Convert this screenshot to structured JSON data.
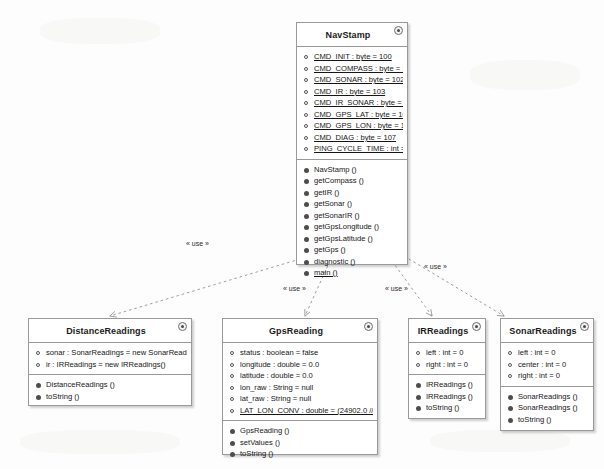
{
  "diagram": {
    "relationship_label": "« use »",
    "classes": [
      {
        "id": "navstamp",
        "name": "NavStamp",
        "icon": "class-badge-icon",
        "attributes": [
          {
            "text": "CMD_INIT : byte = 100",
            "static": true
          },
          {
            "text": "CMD_COMPASS : byte = 101",
            "static": true
          },
          {
            "text": "CMD_SONAR : byte = 102",
            "static": true
          },
          {
            "text": "CMD_IR : byte = 103",
            "static": true
          },
          {
            "text": "CMD_IR_SONAR : byte = 104",
            "static": true
          },
          {
            "text": "CMD_GPS_LAT : byte = 105",
            "static": true
          },
          {
            "text": "CMD_GPS_LON : byte = 106",
            "static": true
          },
          {
            "text": "CMD_DIAG : byte = 107",
            "static": true
          },
          {
            "text": "PING_CYCLE_TIME : int = 200",
            "static": true
          }
        ],
        "operations": [
          {
            "text": "NavStamp ()",
            "static": false
          },
          {
            "text": "getCompass ()",
            "static": false
          },
          {
            "text": "getIR ()",
            "static": false
          },
          {
            "text": "getSonar ()",
            "static": false
          },
          {
            "text": "getSonarIR ()",
            "static": false
          },
          {
            "text": "getGpsLongitude ()",
            "static": false
          },
          {
            "text": "getGpsLatitude ()",
            "static": false
          },
          {
            "text": "getGps ()",
            "static": false
          },
          {
            "text": "diagnostic ()",
            "static": false
          },
          {
            "text": "main ()",
            "static": true
          }
        ]
      },
      {
        "id": "distancereadings",
        "name": "DistanceReadings",
        "icon": "class-badge-icon",
        "attributes": [
          {
            "text": "sonar : SonarReadings = new SonarReadings()",
            "static": false
          },
          {
            "text": "ir : IRReadings = new IRReadings()",
            "static": false
          }
        ],
        "operations": [
          {
            "text": "DistanceReadings ()",
            "static": false
          },
          {
            "text": "toString ()",
            "static": false
          }
        ]
      },
      {
        "id": "gpsreading",
        "name": "GpsReading",
        "icon": "class-badge-icon",
        "attributes": [
          {
            "text": "status : boolean = false",
            "static": false
          },
          {
            "text": "longitude : double = 0.0",
            "static": false
          },
          {
            "text": "latitude : double = 0.0",
            "static": false
          },
          {
            "text": "lon_raw : String = null",
            "static": false
          },
          {
            "text": "lat_raw : String = null",
            "static": false
          },
          {
            "text": "LAT_LON_CONV : double = (24902.0 // miles...",
            "static": true
          }
        ],
        "operations": [
          {
            "text": "GpsReading ()",
            "static": false
          },
          {
            "text": "setValues ()",
            "static": false
          },
          {
            "text": "toString ()",
            "static": false
          }
        ]
      },
      {
        "id": "irreadings",
        "name": "IRReadings",
        "icon": "class-badge-icon",
        "attributes": [
          {
            "text": "left : int = 0",
            "static": false
          },
          {
            "text": "right : int = 0",
            "static": false
          }
        ],
        "operations": [
          {
            "text": "IRReadings ()",
            "static": false
          },
          {
            "text": "IRReadings ()",
            "static": false
          },
          {
            "text": "toString ()",
            "static": false
          }
        ]
      },
      {
        "id": "sonarreadings",
        "name": "SonarReadings",
        "icon": "class-badge-icon",
        "attributes": [
          {
            "text": "left : int = 0",
            "static": false
          },
          {
            "text": "center : int = 0",
            "static": false
          },
          {
            "text": "right : int = 0",
            "static": false
          }
        ],
        "operations": [
          {
            "text": "SonarReadings ()",
            "static": false
          },
          {
            "text": "SonarReadings ()",
            "static": false
          },
          {
            "text": "toString ()",
            "static": false
          }
        ]
      }
    ],
    "dependencies": [
      {
        "from": "NavStamp",
        "to": "DistanceReadings",
        "label": "« use »"
      },
      {
        "from": "NavStamp",
        "to": "GpsReading",
        "label": "« use »"
      },
      {
        "from": "NavStamp",
        "to": "IRReadings",
        "label": "« use »"
      },
      {
        "from": "NavStamp",
        "to": "SonarReadings",
        "label": "« use »"
      }
    ],
    "colors": {
      "box_fill": "#ffffff",
      "box_border": "#9a9a9a",
      "text": "#161616",
      "edge": "#9d9d9d",
      "page_background": "#fdfdfd"
    }
  }
}
